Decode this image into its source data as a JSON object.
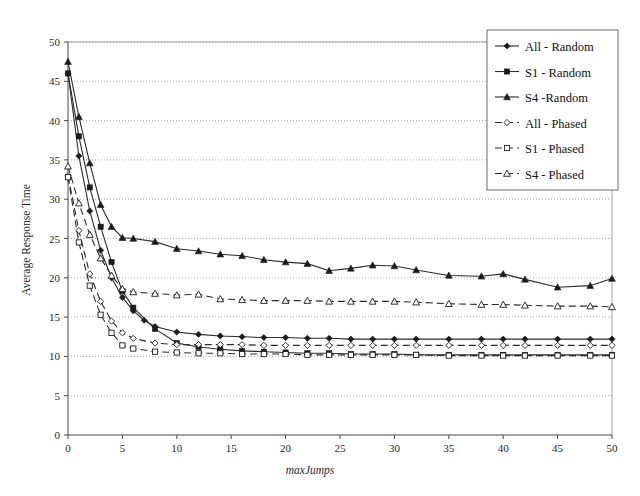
{
  "chart_data": {
    "type": "line",
    "title": "",
    "xlabel": "maxJumps",
    "ylabel": "Average Response Time",
    "xlim": [
      0,
      50
    ],
    "ylim": [
      0,
      50
    ],
    "xticks": [
      0,
      5,
      10,
      15,
      20,
      25,
      30,
      35,
      40,
      45,
      50
    ],
    "yticks": [
      0,
      5,
      10,
      15,
      20,
      25,
      30,
      35,
      40,
      45,
      50
    ],
    "grid": "horizontal-dotted",
    "legend_position": "top-right",
    "series": [
      {
        "name": "All - Random",
        "marker": "filled-diamond",
        "line": "solid",
        "x": [
          0,
          1,
          2,
          3,
          4,
          5,
          6,
          7,
          8,
          10,
          12,
          14,
          16,
          18,
          20,
          22,
          24,
          26,
          28,
          30,
          32,
          35,
          38,
          40,
          42,
          45,
          48,
          50
        ],
        "y": [
          46.0,
          35.5,
          28.5,
          23.5,
          20.0,
          17.5,
          15.8,
          14.6,
          13.8,
          13.1,
          12.8,
          12.6,
          12.5,
          12.4,
          12.4,
          12.3,
          12.3,
          12.2,
          12.2,
          12.2,
          12.2,
          12.2,
          12.2,
          12.2,
          12.2,
          12.2,
          12.2,
          12.2
        ]
      },
      {
        "name": "S1 - Random",
        "marker": "filled-square",
        "line": "solid",
        "x": [
          0,
          1,
          2,
          3,
          4,
          5,
          6,
          8,
          10,
          12,
          14,
          16,
          18,
          20,
          22,
          24,
          26,
          28,
          30,
          32,
          35,
          38,
          40,
          42,
          45,
          48,
          50
        ],
        "y": [
          46.0,
          38.0,
          31.5,
          26.5,
          22.0,
          18.3,
          16.2,
          13.5,
          11.7,
          11.2,
          10.9,
          10.7,
          10.6,
          10.5,
          10.4,
          10.4,
          10.3,
          10.3,
          10.3,
          10.2,
          10.2,
          10.2,
          10.2,
          10.2,
          10.2,
          10.2,
          10.2
        ]
      },
      {
        "name": "S4 -Random",
        "marker": "filled-triangle",
        "line": "solid",
        "x": [
          0,
          1,
          2,
          3,
          4,
          5,
          6,
          8,
          10,
          12,
          14,
          16,
          18,
          20,
          22,
          24,
          26,
          28,
          30,
          32,
          35,
          38,
          40,
          42,
          45,
          48,
          50
        ],
        "y": [
          47.5,
          40.5,
          34.6,
          29.3,
          26.5,
          25.1,
          25.0,
          24.6,
          23.7,
          23.4,
          23.0,
          22.8,
          22.3,
          22.0,
          21.8,
          20.9,
          21.2,
          21.6,
          21.5,
          21.0,
          20.3,
          20.2,
          20.5,
          19.8,
          18.8,
          19.0,
          19.9
        ]
      },
      {
        "name": "All - Phased",
        "marker": "hollow-diamond",
        "line": "dashed",
        "x": [
          0,
          1,
          2,
          3,
          4,
          5,
          6,
          8,
          10,
          12,
          14,
          16,
          18,
          20,
          22,
          24,
          26,
          28,
          30,
          32,
          35,
          38,
          40,
          42,
          45,
          48,
          50
        ],
        "y": [
          33.0,
          26.0,
          20.5,
          17.0,
          14.5,
          13.0,
          12.3,
          11.7,
          11.5,
          11.5,
          11.5,
          11.5,
          11.4,
          11.4,
          11.4,
          11.4,
          11.4,
          11.4,
          11.4,
          11.4,
          11.4,
          11.4,
          11.4,
          11.4,
          11.4,
          11.4,
          11.4
        ]
      },
      {
        "name": "S1 - Phased",
        "marker": "hollow-square",
        "line": "dashed",
        "x": [
          0,
          1,
          2,
          3,
          4,
          5,
          6,
          8,
          10,
          12,
          14,
          16,
          18,
          20,
          22,
          24,
          26,
          28,
          30,
          32,
          35,
          38,
          40,
          42,
          45,
          48,
          50
        ],
        "y": [
          32.8,
          24.5,
          19.0,
          15.3,
          13.0,
          11.4,
          11.0,
          10.6,
          10.5,
          10.4,
          10.4,
          10.3,
          10.3,
          10.3,
          10.2,
          10.2,
          10.2,
          10.2,
          10.2,
          10.2,
          10.1,
          10.1,
          10.1,
          10.1,
          10.1,
          10.1,
          10.1
        ]
      },
      {
        "name": "S4 - Phased",
        "marker": "hollow-triangle",
        "line": "dashed",
        "x": [
          0,
          1,
          2,
          3,
          4,
          5,
          6,
          8,
          10,
          12,
          14,
          16,
          18,
          20,
          22,
          24,
          26,
          28,
          30,
          32,
          35,
          38,
          40,
          42,
          45,
          48,
          50
        ],
        "y": [
          34.2,
          29.5,
          25.5,
          22.5,
          20.3,
          18.6,
          18.2,
          18.0,
          17.8,
          17.9,
          17.3,
          17.2,
          17.1,
          17.1,
          17.1,
          17.0,
          17.0,
          17.0,
          17.0,
          16.9,
          16.7,
          16.6,
          16.6,
          16.5,
          16.4,
          16.4,
          16.3
        ]
      }
    ]
  },
  "legend": {
    "items": [
      {
        "label": "All - Random"
      },
      {
        "label": "S1 - Random"
      },
      {
        "label": "S4 -Random"
      },
      {
        "label": "All - Phased"
      },
      {
        "label": "S1 - Phased"
      },
      {
        "label": "S4 - Phased"
      }
    ]
  },
  "colors": {
    "line": "#2b2b2b",
    "grid": "#8a8a8a",
    "axis": "#4a4a4a",
    "text": "#1a1a1a",
    "background": "#ffffff"
  }
}
